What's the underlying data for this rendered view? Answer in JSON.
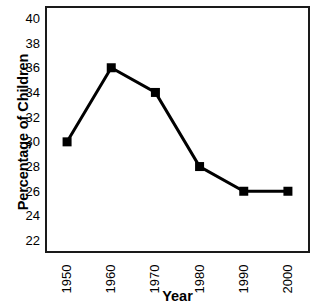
{
  "chart_data": {
    "type": "line",
    "title": "",
    "title_fragment": "................",
    "xlabel": "Year",
    "ylabel": "Percentage of Children",
    "categories": [
      "1950",
      "1960",
      "1970",
      "1980",
      "1990",
      "2000"
    ],
    "x": [
      1950,
      1960,
      1970,
      1980,
      1990,
      2000
    ],
    "values": [
      30,
      36,
      34,
      28,
      26,
      26
    ],
    "series": [
      {
        "name": "Percentage of Children",
        "values": [
          30,
          36,
          34,
          28,
          26,
          26
        ]
      }
    ],
    "ylim": [
      21,
      41
    ],
    "xlim": [
      1945,
      2005
    ],
    "yticks": [
      22,
      24,
      26,
      28,
      30,
      32,
      34,
      36,
      38,
      40
    ],
    "ytick_labels": [
      "22",
      "24",
      "26",
      "28",
      "30",
      "32",
      "34",
      "36",
      "38",
      "40"
    ],
    "xtick_labels": [
      "1950",
      "1960",
      "1970",
      "1980",
      "1990",
      "2000"
    ],
    "xtick_rotation": 90,
    "grid": false,
    "legend": false,
    "legend_position": "none",
    "marker": "square",
    "marker_size": 9,
    "line_width": 3,
    "line_color": "#000000",
    "marker_color": "#000000",
    "frame_color": "#1a1a1a",
    "background_color": "#ffffff",
    "annotations": []
  }
}
